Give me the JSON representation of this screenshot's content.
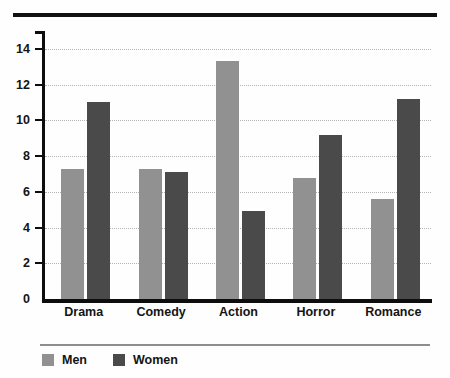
{
  "chart_data": {
    "type": "bar",
    "title": "",
    "subtitle": "",
    "xlabel": "",
    "ylabel": "",
    "categories": [
      "Drama",
      "Comedy",
      "Action",
      "Horror",
      "Romance"
    ],
    "series": [
      {
        "name": "Men",
        "color": "#919191",
        "values": [
          7.3,
          7.3,
          13.3,
          6.8,
          5.6
        ]
      },
      {
        "name": "Women",
        "color": "#4a4a4a",
        "values": [
          11.0,
          7.1,
          4.9,
          9.2,
          11.2
        ]
      }
    ],
    "ylim": [
      0,
      15
    ],
    "yticks": [
      0,
      2,
      4,
      6,
      8,
      10,
      12,
      14
    ],
    "ytick_labels": [
      "0",
      "2",
      "4",
      "6",
      "8",
      "10",
      "12",
      "14"
    ],
    "grid": true,
    "grid_style": "dotted",
    "grid_axis": "y",
    "legend": {
      "position": "bottom-left",
      "entries": [
        {
          "label": "Men",
          "color": "#919191"
        },
        {
          "label": "Women",
          "color": "#4a4a4a"
        }
      ]
    },
    "annotations": [],
    "colors": {
      "men": "#919191",
      "women": "#4a4a4a",
      "axis": "#0d0d0d",
      "gridline": "#b3b3b3",
      "top_rule": "#111111",
      "legend_rule": "#8d8d8d",
      "background": "#fefefe",
      "text": "#141414"
    }
  }
}
